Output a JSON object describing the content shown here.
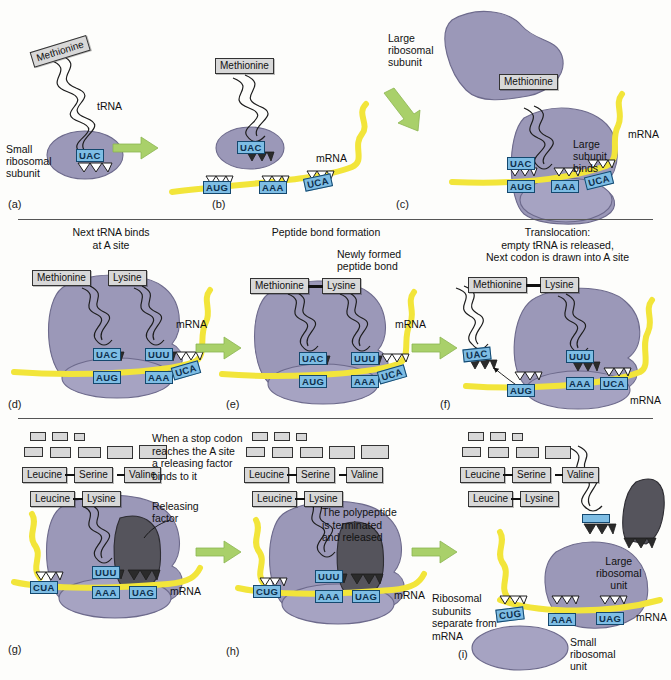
{
  "figure": {
    "colors": {
      "ribosome": "#9b98b8",
      "mrna": "#f2e53a",
      "codon_box": "#7ebde4",
      "amino_acid_box": "#d8d8d8",
      "arrow": "#a9d06a",
      "releasing_factor": "#55545c",
      "background": "#fdfdfb"
    }
  },
  "panels": [
    {
      "id": "a",
      "label": "(a)",
      "caption": "",
      "labels": {
        "amino_acid": "Methionine",
        "trna": "tRNA",
        "subunit": "Small\nribosomal\nsubunit"
      },
      "anticodon": "UAC"
    },
    {
      "id": "b",
      "label": "(b)",
      "caption": "",
      "labels": {
        "amino_acid": "Methionine",
        "mrna": "mRNA"
      },
      "anticodon": "UAC",
      "codons": [
        "AUG",
        "AAA",
        "UCA"
      ]
    },
    {
      "id": "c",
      "label": "(c)",
      "caption": "",
      "labels": {
        "large_subunit": "Large\nribosomal\nsubunit",
        "amino_acid": "Methionine",
        "binds": "Large\nsubunit\nbinds",
        "mrna": "mRNA"
      },
      "anticodon": "UAC",
      "codons": [
        "AUG",
        "AAA",
        "UCA"
      ]
    },
    {
      "id": "d",
      "label": "(d)",
      "caption": "Next tRNA binds\nat A site",
      "labels": {
        "aa1": "Methionine",
        "aa2": "Lysine",
        "mrna": "mRNA"
      },
      "anticodons": [
        "UAC",
        "UUU"
      ],
      "codons": [
        "AUG",
        "AAA",
        "UCA"
      ]
    },
    {
      "id": "e",
      "label": "(e)",
      "caption": "Peptide bond formation",
      "labels": {
        "aa1": "Methionine",
        "aa2": "Lysine",
        "bond": "Newly formed\npeptide bond",
        "mrna": "mRNA"
      },
      "anticodons": [
        "UAC",
        "UUU"
      ],
      "codons": [
        "AUG",
        "AAA",
        "UCA"
      ]
    },
    {
      "id": "f",
      "label": "(f)",
      "caption": "Translocation:\nempty tRNA is released,\nNext codon is drawn into A site",
      "labels": {
        "aa1": "Methionine",
        "aa2": "Lysine",
        "mrna": "mRNA"
      },
      "anticodons": [
        "UAC",
        "UUU"
      ],
      "codons": [
        "AUG",
        "AAA",
        "UCA"
      ]
    },
    {
      "id": "g",
      "label": "(g)",
      "caption": "When a stop codon\nreaches the A site\na releasing factor\nbinds to it",
      "labels": {
        "releasing_factor": "Releasing\nfactor",
        "mrna": "mRNA"
      },
      "peptide_row1": [
        "Leucine",
        "Serine",
        "Valine"
      ],
      "peptide_row2": [
        "Leucine",
        "Lysine"
      ],
      "anticodon": "UUU",
      "codons": [
        "CUA",
        "AAA",
        "UAG"
      ]
    },
    {
      "id": "h",
      "label": "(h)",
      "caption": "The polypeptide\nis terminated\nand released",
      "labels": {
        "mrna": "mRNA"
      },
      "peptide_row1": [
        "Leucine",
        "Serine",
        "Valine"
      ],
      "peptide_row2": [
        "Leucine",
        "Lysine"
      ],
      "anticodon": "UUU",
      "codons": [
        "CUG",
        "AAA",
        "UAG"
      ]
    },
    {
      "id": "i",
      "label": "(i)",
      "caption": "Ribosomal\nsubunits\nseparate from\nmRNA",
      "labels": {
        "large_unit": "Large\nribosomal\nunit",
        "small_unit": "Small\nribosomal\nunit",
        "mrna": "mRNA"
      },
      "peptide_row1": [
        "Leucine",
        "Serine",
        "Valine"
      ],
      "peptide_row2": [
        "Leucine",
        "Lysine"
      ],
      "codons": [
        "CUG",
        "AAA",
        "UAG"
      ]
    }
  ]
}
